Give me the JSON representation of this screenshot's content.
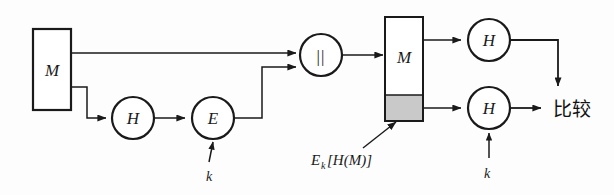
{
  "diagram": {
    "colors": {
      "background": "#fdfdfd",
      "stroke": "#1a1a1a",
      "shape_fill": "#ffffff",
      "tag_fill": "#c9c9c9",
      "text": "#1a1a1a"
    },
    "nodes": {
      "source_message_box": {
        "label": "M",
        "shape": "rectangle"
      },
      "hash_sender": {
        "label": "H",
        "shape": "circle"
      },
      "encrypt": {
        "label": "E",
        "shape": "circle"
      },
      "concat": {
        "label": "||",
        "shape": "circle"
      },
      "received_message_box": {
        "label": "M",
        "shape": "rectangle-with-tag"
      },
      "hash_top_receiver": {
        "label": "H",
        "shape": "circle"
      },
      "hash_bottom_receiver": {
        "label": "H",
        "shape": "circle"
      }
    },
    "labels": {
      "key_sender": "k",
      "key_receiver": "k",
      "tag_annotation_base": "E",
      "tag_annotation_sub": "k",
      "tag_annotation_rest": "[H(M)]",
      "compare": "比较"
    }
  }
}
